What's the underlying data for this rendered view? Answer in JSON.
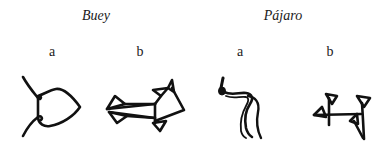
{
  "groups": [
    {
      "title": "Buey",
      "variants": [
        {
          "label": "a",
          "glyph": "ox-pictograph-icon"
        },
        {
          "label": "b",
          "glyph": "ox-cuneiform-icon"
        }
      ]
    },
    {
      "title": "Pájaro",
      "variants": [
        {
          "label": "a",
          "glyph": "bird-pictograph-icon"
        },
        {
          "label": "b",
          "glyph": "bird-cuneiform-icon"
        }
      ]
    }
  ]
}
